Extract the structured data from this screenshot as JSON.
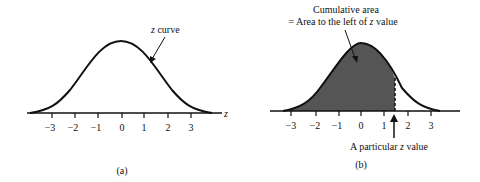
{
  "panel_a": {
    "curve_label_prefix": "z",
    "curve_label_suffix": " curve",
    "axis_label": "z",
    "ticks": [
      "−3",
      "−2",
      "−1",
      "0",
      "1",
      "2",
      "3"
    ],
    "caption": "(a)"
  },
  "panel_b": {
    "area_label_line1": "Cumulative area",
    "area_label_line2_prefix": "= Area to the left of ",
    "area_label_line2_z": "z",
    "area_label_line2_suffix": " value",
    "ticks": [
      "−3",
      "−2",
      "−1",
      "0",
      "1",
      "2",
      "3"
    ],
    "particular_prefix": "A particular ",
    "particular_z": "z",
    "particular_suffix": " value",
    "caption": "(b)",
    "shade_color": "#555555"
  }
}
